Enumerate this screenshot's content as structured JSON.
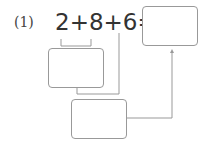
{
  "problem": {
    "label": "(1)",
    "expression": "2+8+6=",
    "terms": [
      "2",
      "8",
      "6"
    ],
    "answer_box": "",
    "step1_box": "",
    "step2_box": ""
  },
  "colors": {
    "line": "#999999",
    "text": "#333333"
  }
}
